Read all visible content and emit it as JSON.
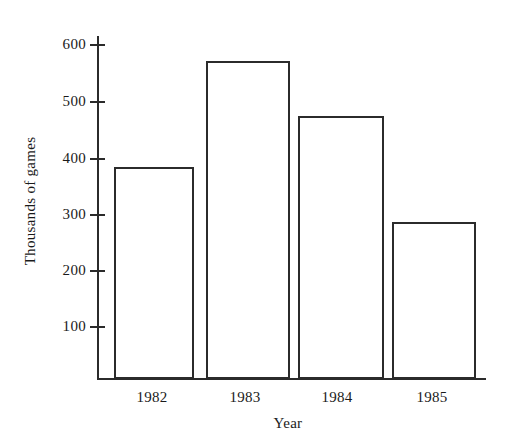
{
  "chart_data": {
    "type": "bar",
    "title": "",
    "subtitle": "",
    "xlabel": "Year",
    "ylabel": "Thousands of games",
    "categories": [
      "1982",
      "1983",
      "1984",
      "1985"
    ],
    "values": [
      400,
      600,
      497,
      297
    ],
    "series": [
      {
        "name": "Thousands of games",
        "values": [
          400,
          600,
          497,
          297
        ]
      }
    ],
    "ylim": [
      0,
      640
    ],
    "xlim": [
      0,
      4
    ],
    "yticks": [
      100,
      200,
      300,
      400,
      500,
      600
    ],
    "ytick_labels": [
      "100",
      "200",
      "300",
      "400",
      "500",
      "600"
    ],
    "xtick_labels": [
      "1982",
      "1983",
      "1984",
      "1985"
    ],
    "grid": false,
    "legend": false,
    "legend_position": "none",
    "bar_fill_color": "#ffffff",
    "bar_edge_color": "#2b2b2b",
    "axis_color": "#2b2b2b",
    "background_color": "#ffffff"
  },
  "axes": {
    "y_axis_title": "Thousands of games",
    "x_axis_title": "Year"
  }
}
